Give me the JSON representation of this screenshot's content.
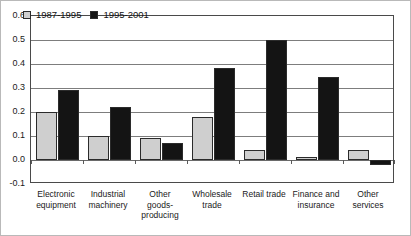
{
  "chart_data": {
    "type": "bar",
    "title": "",
    "subtitle": "",
    "xlabel": "",
    "ylabel": "",
    "ylim": [
      -0.1,
      0.6
    ],
    "ytick_labels": [
      "0.6",
      "0.5",
      "0.4",
      "0.3",
      "0.2",
      "0.1",
      "0.0",
      "-0.1"
    ],
    "ytick_values": [
      0.6,
      0.5,
      0.4,
      0.3,
      0.2,
      0.1,
      0.0,
      -0.1
    ],
    "grid": true,
    "legend_position": "top-left-inside",
    "categories": [
      "Electronic equipment",
      "Industrial machinery",
      "Other goods-producing",
      "Wholesale trade",
      "Retail trade",
      "Finance and insurance",
      "Other services"
    ],
    "category_label_lines": [
      [
        "Electronic",
        "equipment"
      ],
      [
        "Industrial",
        "machinery"
      ],
      [
        "Other",
        "goods-",
        "producing"
      ],
      [
        "Wholesale",
        "trade"
      ],
      [
        "Retail trade"
      ],
      [
        "Finance and",
        "insurance"
      ],
      [
        "Other",
        "services"
      ]
    ],
    "series": [
      {
        "name": "1987-1995",
        "color": "#cfcfcf",
        "values": [
          0.2,
          0.1,
          0.093,
          0.18,
          0.042,
          0.012,
          0.042
        ]
      },
      {
        "name": "1995-2001",
        "color": "#141414",
        "values": [
          0.29,
          0.22,
          0.072,
          0.382,
          0.5,
          0.345,
          -0.02
        ]
      }
    ]
  },
  "legend": {
    "entries": [
      {
        "label": "1987-1995",
        "swatch": "legend-swatch-gray"
      },
      {
        "label": "1995-2001",
        "swatch": "legend-swatch-black"
      }
    ]
  }
}
